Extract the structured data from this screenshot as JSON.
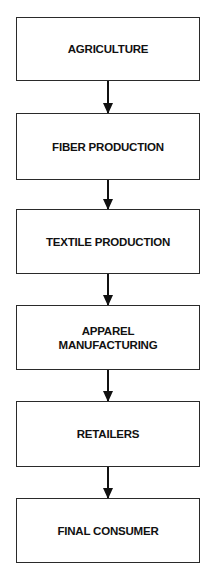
{
  "diagram": {
    "type": "flowchart",
    "direction": "top-to-bottom",
    "nodes": [
      {
        "id": "agriculture",
        "label": "AGRICULTURE"
      },
      {
        "id": "fiber-production",
        "label": "FIBER PRODUCTION"
      },
      {
        "id": "textile-production",
        "label": "TEXTILE PRODUCTION"
      },
      {
        "id": "apparel-manufacturing",
        "label": "APPAREL\nMANUFACTURING"
      },
      {
        "id": "retailers",
        "label": "RETAILERS"
      },
      {
        "id": "final-consumer",
        "label": "FINAL CONSUMER"
      }
    ],
    "edges": [
      {
        "from": "agriculture",
        "to": "fiber-production"
      },
      {
        "from": "fiber-production",
        "to": "textile-production"
      },
      {
        "from": "textile-production",
        "to": "apparel-manufacturing"
      },
      {
        "from": "apparel-manufacturing",
        "to": "retailers"
      },
      {
        "from": "retailers",
        "to": "final-consumer"
      }
    ]
  }
}
